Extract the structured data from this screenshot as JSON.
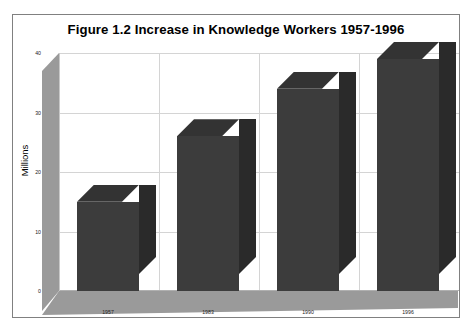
{
  "chart_data": {
    "type": "bar",
    "title": "Figure 1.2  Increase in Knowledge Workers 1957-1996",
    "xlabel": "",
    "ylabel": "Millions",
    "categories": [
      "1957",
      "1983",
      "1990",
      "1996"
    ],
    "values": [
      15,
      26,
      34,
      39
    ],
    "ylim": [
      0,
      40
    ],
    "yticks": [
      0,
      10,
      20,
      30,
      40
    ],
    "ytick_labels": [
      "0",
      "10",
      "20",
      "30",
      "40"
    ],
    "grid": true,
    "legend": "none",
    "style": "3d-column",
    "series": [
      {
        "name": "Knowledge Workers",
        "values": [
          15,
          26,
          34,
          39
        ]
      }
    ]
  },
  "colors": {
    "bar_front": "#3c3c3c",
    "bar_side": "#2a2a2a",
    "bar_top": "#333333",
    "wall": "#9a9a9a",
    "gridline": "#d4d4d4",
    "frame": "#808080",
    "background": "#ffffff",
    "text": "#000000"
  },
  "ticks": {
    "y0": "0",
    "y1": "10",
    "y2": "20",
    "y3": "30",
    "y4": "40"
  },
  "xlabels": {
    "c0": "1957",
    "c1": "1983",
    "c2": "1990",
    "c3": "1996"
  }
}
